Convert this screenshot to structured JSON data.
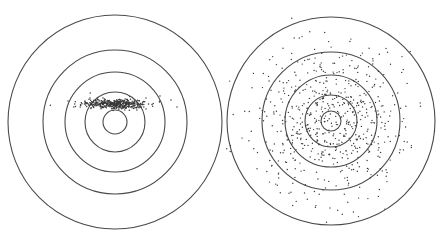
{
  "figure": {
    "background": "#ffffff",
    "ring_color": "#4a4a4a",
    "dot_color": "#3a3a3a"
  },
  "targets": [
    {
      "id": "precise-not-accurate",
      "center": [
        115,
        122
      ],
      "ring_radii": [
        107,
        72,
        50,
        30,
        12
      ],
      "scatter": {
        "pattern": "horizontal-band",
        "count": 420,
        "mean": [
          115,
          104
        ],
        "sigma": [
          16,
          2.6
        ],
        "outliers": [
          [
            68,
            101
          ],
          [
            171,
            100
          ],
          [
            177,
            107
          ],
          [
            160,
            96
          ],
          [
            146,
            98
          ]
        ],
        "dot_radius": 0.75
      }
    },
    {
      "id": "accurate-not-precise",
      "center": [
        331,
        121
      ],
      "ring_radii": [
        104,
        69,
        46,
        26,
        10
      ],
      "scatter": {
        "pattern": "wide-gaussian",
        "count": 620,
        "mean": [
          331,
          121
        ],
        "sigma": [
          38,
          38
        ],
        "outliers": [],
        "dot_radius": 0.7
      }
    }
  ]
}
